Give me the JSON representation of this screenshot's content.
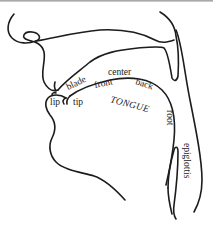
{
  "diagram": {
    "labels": {
      "lip": "lip",
      "tip": "tip",
      "blade": "blade",
      "front": "front",
      "center": "center",
      "back": "back",
      "tongue": "TONGUE",
      "root": "root",
      "epiglottis": "epiglottis"
    },
    "colors": {
      "line": "#1c1c1c",
      "text": "#222222",
      "background": "#ffffff"
    }
  }
}
